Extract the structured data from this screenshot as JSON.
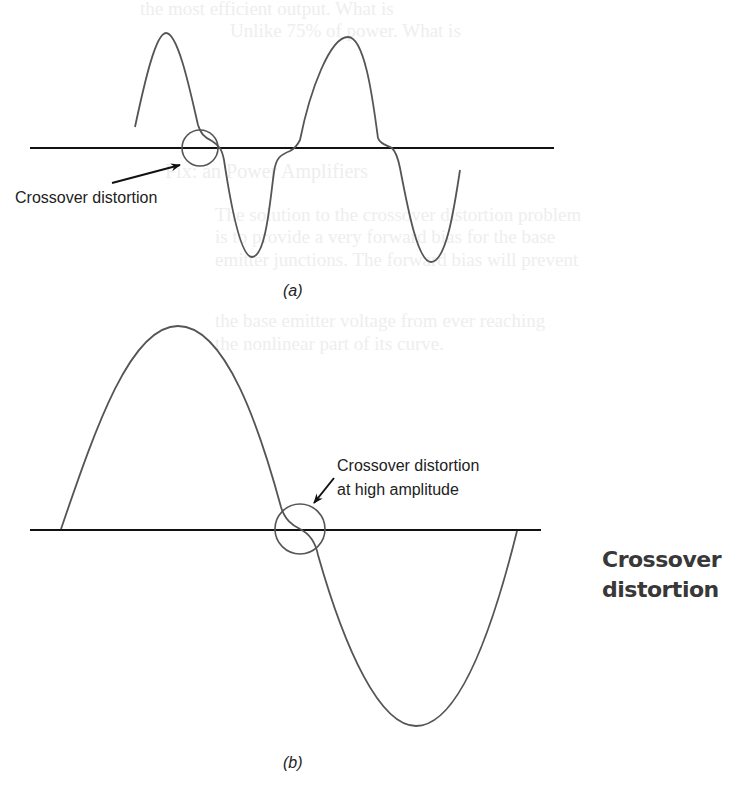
{
  "figure": {
    "panel_a": {
      "caption": "(a)",
      "annotation": "Crossover distortion",
      "axis": {
        "x1": 30,
        "x2": 554,
        "y": 148
      },
      "circle": {
        "cx": 200,
        "cy": 148,
        "r": 18
      },
      "waveform_path": "M135,127 C145,80 156,33 166,33 C178,33 190,90 198,125 C201,134 204,137 212,141 C220,146 222,150 224,160 C230,200 240,257 252,257 C266,257 270,200 274,172 C276,158 280,155 290,151 C296,148 298,144 300,140 C310,90 330,37 348,37 C366,37 374,110 378,138 C380,144 386,145 392,148 C396,152 398,158 400,168 C408,210 418,262 431,262 C446,262 454,210 460,170",
      "arrow": {
        "x1": 112,
        "y1": 183,
        "x2": 180,
        "y2": 165
      }
    },
    "panel_b": {
      "caption": "(b)",
      "annotation_line1": "Crossover distortion",
      "annotation_line2": "at high amplitude",
      "axis": {
        "x1": 30,
        "x2": 541,
        "y": 530
      },
      "circle": {
        "cx": 300,
        "cy": 529,
        "r": 25
      },
      "waveform_path": "M61,529 C95,430 130,326 178,326 C226,326 260,430 281,507 C285,520 292,525 300,529 C308,533 315,540 318,555 C345,650 380,726 416,726 C456,726 490,640 517,531",
      "arrow": {
        "x1": 334,
        "y1": 478,
        "x2": 314,
        "y2": 503
      }
    },
    "side_title_line1": "Crossover",
    "side_title_line2": "distortion"
  },
  "bleed_through_text": [
    "the most efficient output. What is",
    "Unlike 75% of power. What is",
    "Fix: an  Power Amplifiers",
    "The solution to the crossover distortion problem",
    "is to provide a very forward bias for the base",
    "emitter junctions. The forward bias will prevent",
    "the base emitter voltage from ever reaching",
    "the nonlinear part of its curve."
  ],
  "colors": {
    "waveform": "#555555",
    "axis": "#111111",
    "text": "#222222",
    "side_title": "#383838"
  }
}
